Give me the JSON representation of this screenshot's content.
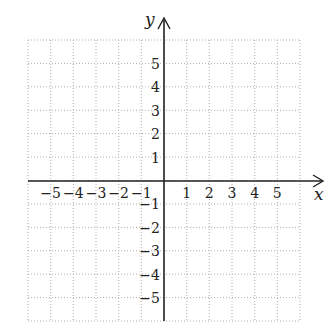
{
  "chart_data": {
    "type": "scatter",
    "title": "",
    "xlabel": "x",
    "ylabel": "y",
    "xlim": [
      -6,
      6
    ],
    "ylim": [
      -6,
      6
    ],
    "grid": true,
    "grid_style": "dotted",
    "x_ticks": [
      "-5",
      "-4",
      "-3",
      "-2",
      "-1",
      "1",
      "2",
      "3",
      "4",
      "5"
    ],
    "y_ticks": [
      "5",
      "4",
      "3",
      "2",
      "1",
      "-1",
      "-2",
      "-3",
      "-4",
      "-5"
    ],
    "series": []
  },
  "labels": {
    "x_axis": "x",
    "y_axis": "y",
    "x_tick_labels": [
      "−5",
      "−4",
      "−3",
      "−2",
      "−1",
      "1",
      "2",
      "3",
      "4",
      "5"
    ],
    "y_tick_labels": [
      "5",
      "4",
      "3",
      "2",
      "1",
      "−1",
      "−2",
      "−3",
      "−4",
      "−5"
    ]
  }
}
